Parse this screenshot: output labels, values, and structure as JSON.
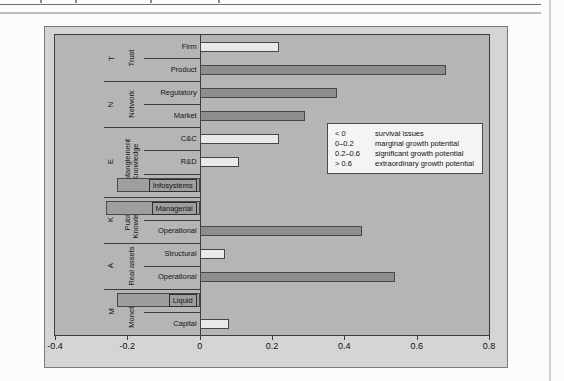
{
  "colors": {
    "figure_bg": "#d3d3d3",
    "plot_bg": "#b3b3b3",
    "axis": "#3c3c3c",
    "legend_bg": "#f4f4f4"
  },
  "chart_data": {
    "type": "bar",
    "orientation": "horizontal",
    "xlim": [
      -0.4,
      0.8
    ],
    "x_ticks": [
      "-0.4",
      "-0.2",
      "0",
      "0.2",
      "0.4",
      "0.6",
      "0.8"
    ],
    "x_tick_values": [
      -0.4,
      -0.2,
      0,
      0.2,
      0.4,
      0.6,
      0.8
    ],
    "grid": false,
    "bar_styles": {
      "dark": "#8e8e8e",
      "mid": "#9e9e9e",
      "light": "#e9e9e9"
    },
    "groups": [
      {
        "letter": "T",
        "name": "Trust",
        "rows": [
          {
            "label": "Firm",
            "value": 0.22,
            "style": "light",
            "boxed": false
          },
          {
            "label": "Product",
            "value": 0.68,
            "style": "dark",
            "boxed": false
          }
        ]
      },
      {
        "letter": "N",
        "name": "Network",
        "rows": [
          {
            "label": "Regulatory",
            "value": 0.38,
            "style": "dark",
            "boxed": false
          },
          {
            "label": "Market",
            "value": 0.29,
            "style": "dark",
            "boxed": false
          }
        ]
      },
      {
        "letter": "E",
        "name": "Entanglement\nKnowledge",
        "rows": [
          {
            "label": "C&C",
            "value": 0.22,
            "style": "light",
            "boxed": false
          },
          {
            "label": "R&D",
            "value": 0.11,
            "style": "light",
            "boxed": false
          },
          {
            "label": "Infosystems",
            "value": -0.23,
            "style": "mid",
            "boxed": true
          }
        ]
      },
      {
        "letter": "K",
        "name": "Public\nKnowledge",
        "rows": [
          {
            "label": "Managerial",
            "value": -0.26,
            "style": "mid",
            "boxed": true
          },
          {
            "label": "Operational",
            "value": 0.45,
            "style": "dark",
            "boxed": false
          }
        ]
      },
      {
        "letter": "A",
        "name": "Real assets",
        "rows": [
          {
            "label": "Structural",
            "value": 0.07,
            "style": "light",
            "boxed": false
          },
          {
            "label": "Operational",
            "value": 0.54,
            "style": "dark",
            "boxed": false
          }
        ]
      },
      {
        "letter": "M",
        "name": "Monetary",
        "rows": [
          {
            "label": "Liquid",
            "value": -0.23,
            "style": "mid",
            "boxed": true
          },
          {
            "label": "Capital",
            "value": 0.08,
            "style": "light",
            "boxed": false
          }
        ]
      }
    ],
    "legend": {
      "position": "center-right",
      "items": [
        {
          "range": "< 0",
          "label": "survival issues"
        },
        {
          "range": "0–0.2",
          "label": "marginal growth potential"
        },
        {
          "range": "0.2–0.6",
          "label": "significant growth potential"
        },
        {
          "range": "> 0.6",
          "label": "extraordinary growth potential"
        }
      ]
    }
  }
}
